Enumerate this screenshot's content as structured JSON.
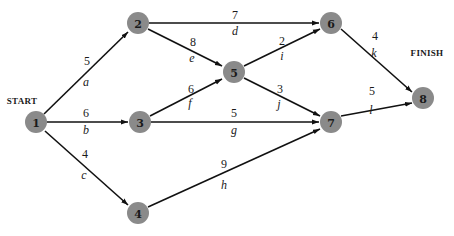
{
  "diagram": {
    "type": "activity-network",
    "colors": {
      "node_fill": "#8a8a8a",
      "edge": "#111111",
      "text": "#1a1a1a"
    },
    "labels": {
      "start": "START",
      "finish": "FINISH"
    },
    "nodes": [
      {
        "id": "1",
        "label": "1",
        "x": 36,
        "y": 122
      },
      {
        "id": "2",
        "label": "2",
        "x": 138,
        "y": 23
      },
      {
        "id": "3",
        "label": "3",
        "x": 140,
        "y": 122
      },
      {
        "id": "4",
        "label": "4",
        "x": 138,
        "y": 213
      },
      {
        "id": "5",
        "label": "5",
        "x": 234,
        "y": 72
      },
      {
        "id": "6",
        "label": "6",
        "x": 331,
        "y": 23
      },
      {
        "id": "7",
        "label": "7",
        "x": 331,
        "y": 122
      },
      {
        "id": "8",
        "label": "8",
        "x": 423,
        "y": 98
      }
    ],
    "edges": [
      {
        "activity": "a",
        "duration": "5",
        "from": "1",
        "to": "2"
      },
      {
        "activity": "b",
        "duration": "6",
        "from": "1",
        "to": "3"
      },
      {
        "activity": "c",
        "duration": "4",
        "from": "1",
        "to": "4"
      },
      {
        "activity": "d",
        "duration": "7",
        "from": "2",
        "to": "6"
      },
      {
        "activity": "e",
        "duration": "8",
        "from": "2",
        "to": "5"
      },
      {
        "activity": "f",
        "duration": "6",
        "from": "3",
        "to": "5"
      },
      {
        "activity": "g",
        "duration": "5",
        "from": "3",
        "to": "7"
      },
      {
        "activity": "h",
        "duration": "9",
        "from": "4",
        "to": "7"
      },
      {
        "activity": "i",
        "duration": "2",
        "from": "5",
        "to": "6"
      },
      {
        "activity": "j",
        "duration": "3",
        "from": "5",
        "to": "7"
      },
      {
        "activity": "k",
        "duration": "4",
        "from": "6",
        "to": "8"
      },
      {
        "activity": "l",
        "duration": "5",
        "from": "7",
        "to": "8"
      }
    ]
  }
}
